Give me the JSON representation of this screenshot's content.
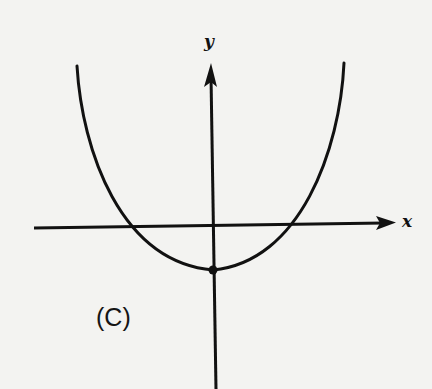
{
  "figure": {
    "panel_label": "(C)",
    "x_axis_label": "x",
    "y_axis_label": "y",
    "curve": {
      "type": "parabola",
      "opens": "upward",
      "vertex": "below x-axis on y-axis (marked with dot)",
      "x_intercepts": 2
    },
    "colors": {
      "ink": "#111111",
      "paper": "#f3f3f1"
    }
  }
}
